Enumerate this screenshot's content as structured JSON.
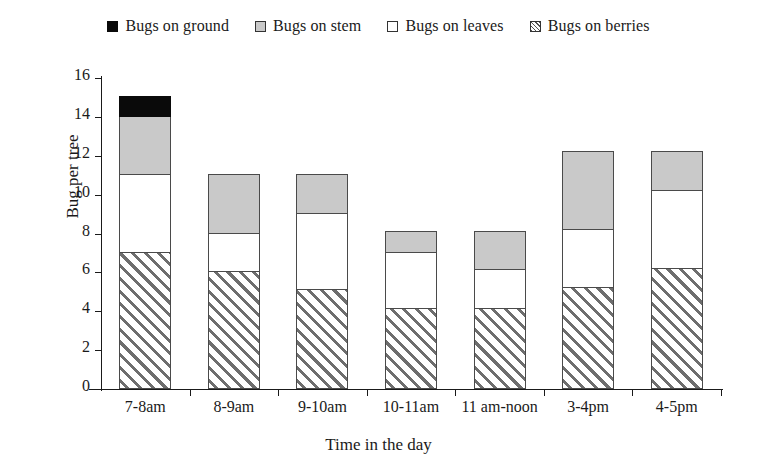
{
  "chart_data": {
    "type": "bar",
    "subtype": "stacked-vertical",
    "title": "",
    "xlabel": "Time in the day",
    "ylabel": "Bug per tree",
    "categories": [
      "7-8am",
      "8-9am",
      "9-10am",
      "10-11am",
      "11 am-noon",
      "3-4pm",
      "4-5pm"
    ],
    "series": [
      {
        "name": "Bugs on berries",
        "values": [
          7.0,
          6.0,
          5.1,
          4.1,
          4.1,
          5.2,
          6.2
        ]
      },
      {
        "name": "Bugs on leaves",
        "values": [
          4.0,
          2.0,
          3.9,
          2.9,
          2.0,
          3.0,
          4.0
        ]
      },
      {
        "name": "Bugs on stem",
        "values": [
          3.0,
          3.0,
          2.0,
          1.1,
          2.0,
          4.0,
          2.0
        ]
      },
      {
        "name": "Bugs on ground",
        "values": [
          1.0,
          0.0,
          0.0,
          0.0,
          0.0,
          0.0,
          0.0
        ]
      }
    ],
    "totals": [
      15.0,
      11.0,
      11.0,
      8.1,
      8.1,
      12.2,
      12.2
    ],
    "ylim": [
      0,
      16
    ],
    "yticks": [
      0,
      2,
      4,
      6,
      8,
      10,
      12,
      14,
      16
    ],
    "ytick_labels": [
      "0",
      "2",
      "4",
      "6",
      "8",
      "10",
      "12",
      "14",
      "16"
    ],
    "grid": false,
    "legend_position": "top-center",
    "colors": {
      "bugs_on_ground": "#0a0a0a",
      "bugs_on_stem": "#c9c9c9",
      "bugs_on_leaves": "#ffffff",
      "bugs_on_berries": "#6e6e6e",
      "axis": "#1a1a1a"
    }
  },
  "legend": {
    "items": [
      {
        "label": "Bugs on ground",
        "swatch": "legend-swatch-black",
        "key": "ground"
      },
      {
        "label": "Bugs on stem",
        "swatch": "legend-swatch-gray",
        "key": "stem"
      },
      {
        "label": "Bugs on leaves",
        "swatch": "legend-swatch-white",
        "key": "leaves"
      },
      {
        "label": "Bugs on berries",
        "swatch": "legend-swatch-hatched",
        "key": "berries"
      }
    ]
  },
  "axes": {
    "y_title": "Bug per tree",
    "x_title": "Time in the day"
  }
}
